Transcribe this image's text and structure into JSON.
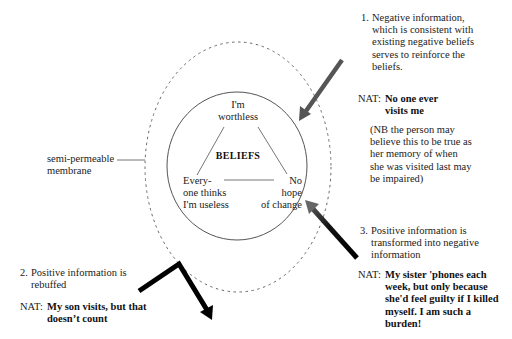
{
  "diagram": {
    "core": {
      "title": "BELIEFS",
      "beliefs": [
        {
          "lines": [
            "I'm",
            "worthless"
          ]
        },
        {
          "lines": [
            "Every-",
            "one thinks",
            "I'm useless"
          ]
        },
        {
          "lines": [
            "No",
            "hope",
            "of change"
          ]
        }
      ]
    },
    "membrane_label": [
      "semi-permeable",
      "membrane"
    ],
    "points": [
      {
        "number": "1.",
        "lines": [
          "Negative information,",
          "which is consistent with",
          "existing negative beliefs",
          "serves to reinforce the",
          "beliefs."
        ],
        "nat_label": "NAT:",
        "nat_lines": [
          "No one ever",
          "visits me"
        ],
        "note_lines": [
          "(NB the person may",
          "believe this to be true as",
          "her memory of when",
          "she was visited last may",
          "be impaired)"
        ]
      },
      {
        "number": "2.",
        "lines": [
          "Positive information is",
          "rebuffed"
        ],
        "nat_label": "NAT:",
        "nat_lines": [
          "My son visits, but that",
          "doesn’t count"
        ]
      },
      {
        "number": "3.",
        "lines": [
          "Positive information is",
          "transformed into negative",
          "information"
        ],
        "nat_label": "NAT:",
        "nat_lines": [
          "My sister 'phones each",
          "week, but only because",
          "she'd feel guilty if I killed",
          "myself. I am such a",
          "burden!"
        ]
      }
    ],
    "colors": {
      "line": "#555555",
      "arrow_dark": "#000000",
      "arrow_gray": "#555555",
      "membrane": "#666666"
    }
  }
}
